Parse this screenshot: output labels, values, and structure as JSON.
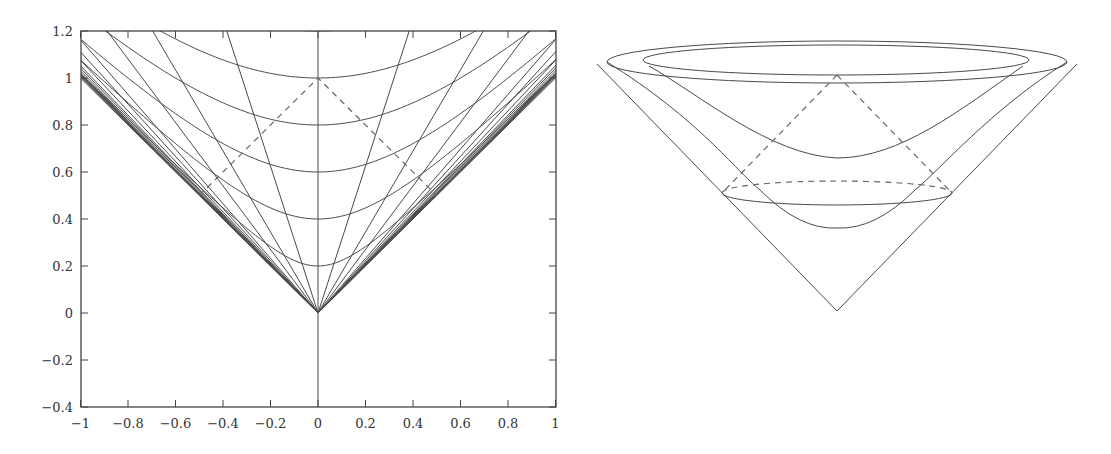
{
  "chart_data": [
    {
      "type": "line",
      "title": "",
      "xlabel": "",
      "ylabel": "",
      "xlim": [
        -1,
        1
      ],
      "ylim": [
        -0.4,
        1.2
      ],
      "grid": false,
      "legend": null,
      "x_ticks": [
        "−1",
        "−0.8",
        "−0.6",
        "−0.4",
        "−0.2",
        "0",
        "0.2",
        "0.4",
        "0.6",
        "0.8",
        "1"
      ],
      "x_tick_values": [
        -1,
        -0.8,
        -0.6,
        -0.4,
        -0.2,
        0,
        0.2,
        0.4,
        0.6,
        0.8,
        1
      ],
      "y_ticks": [
        "1.2",
        "1",
        "0.8",
        "0.6",
        "0.4",
        "0.2",
        "0",
        "−0.2",
        "−0.4"
      ],
      "y_tick_values": [
        1.2,
        1,
        0.8,
        0.6,
        0.4,
        0.2,
        0,
        -0.2,
        -0.4
      ],
      "series": [
        {
          "name": "hyperbola c=0.2",
          "kind": "hyperbola",
          "equation": "t = sqrt(x^2 + 0.2^2)",
          "vertex": [
            0,
            0.2
          ]
        },
        {
          "name": "hyperbola c=0.4",
          "kind": "hyperbola",
          "equation": "t = sqrt(x^2 + 0.4^2)",
          "vertex": [
            0,
            0.4
          ]
        },
        {
          "name": "hyperbola c=0.6",
          "kind": "hyperbola",
          "equation": "t = sqrt(x^2 + 0.6^2)",
          "vertex": [
            0,
            0.6
          ]
        },
        {
          "name": "hyperbola c=0.8",
          "kind": "hyperbola",
          "equation": "t = sqrt(x^2 + 0.8^2)",
          "vertex": [
            0,
            0.8
          ]
        },
        {
          "name": "hyperbola c=1.0",
          "kind": "hyperbola",
          "equation": "t = sqrt(x^2 + 1.0^2)",
          "vertex": [
            0,
            1.0
          ]
        },
        {
          "name": "hyperbola c=1.2",
          "kind": "hyperbola",
          "equation": "t = sqrt(x^2 + 1.2^2)",
          "vertex": [
            0,
            1.2
          ]
        },
        {
          "name": "worldlines from origin",
          "kind": "rays",
          "slopes_v": [
            0,
            0.32,
            0.58,
            0.74,
            0.86,
            0.93,
            0.96,
            0.98,
            0.99,
            1.0
          ],
          "symmetric": true
        },
        {
          "name": "light cone of (0,1)",
          "kind": "dashed",
          "points": [
            [
              -0.5,
              0.5
            ],
            [
              0,
              1
            ],
            [
              0.5,
              0.5
            ]
          ]
        }
      ]
    },
    {
      "type": "diagram",
      "title": "",
      "description": "3D light cone with hyperboloid slices and dashed past light cone",
      "elements": [
        {
          "name": "outer-cone",
          "kind": "cone",
          "apex": "bottom"
        },
        {
          "name": "rim-ellipse-outer",
          "kind": "ellipse"
        },
        {
          "name": "rim-ellipse-inner",
          "kind": "ellipse"
        },
        {
          "name": "hyperboloid-upper",
          "kind": "hyperboloid"
        },
        {
          "name": "hyperboloid-lower",
          "kind": "hyperboloid"
        },
        {
          "name": "slice-ellipse",
          "kind": "ellipse",
          "back_half": "dashed",
          "front_half": "solid"
        },
        {
          "name": "past-light-cone",
          "kind": "dashed-cone"
        }
      ]
    }
  ],
  "plot_left": {
    "box": {
      "left": 81,
      "top": 31,
      "right": 556,
      "bottom": 407
    },
    "origin_px": [
      318,
      313
    ],
    "px_per_unit_x": 237.5,
    "px_per_unit_y": 235,
    "colors": {
      "line": "#4a4a4a",
      "frame": "#444444",
      "dashed": "#666666"
    }
  },
  "plot_right": {
    "apex_px": [
      837,
      311
    ],
    "outer_ellipse": {
      "cx": 837,
      "cy": 62,
      "rx": 230,
      "ry": 21
    },
    "inner_ellipse": {
      "cx": 836,
      "cy": 60,
      "rx": 193,
      "ry": 15
    },
    "slice_ellipse": {
      "cx": 837,
      "cy": 193,
      "rx": 115,
      "ry": 12
    },
    "dashed_apex_px": [
      837,
      75
    ],
    "upper_hyperbola_min_px": [
      837,
      158
    ],
    "lower_hyperbola_min_px": [
      837,
      228
    ]
  }
}
